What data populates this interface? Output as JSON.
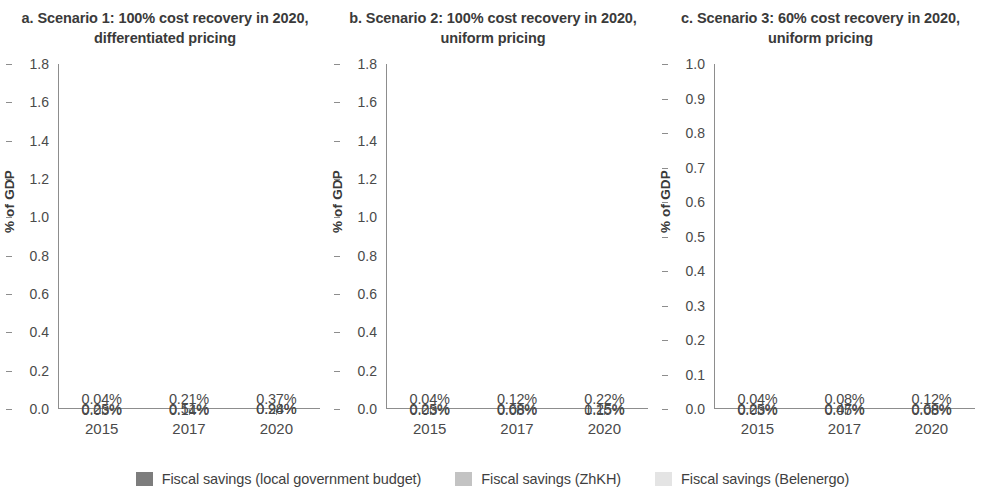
{
  "figure": {
    "ylabel": "% of GDP",
    "legend": {
      "position": "bottom",
      "items": [
        {
          "label": "Fiscal savings (local government budget)",
          "color": "#7d7d7d"
        },
        {
          "label": "Fiscal savings (ZhKH)",
          "color": "#c3c3c3"
        },
        {
          "label": "Fiscal savings (Belenergo)",
          "color": "#e4e4e4"
        }
      ]
    }
  },
  "chart_data": [
    {
      "type": "bar",
      "title": "a. Scenario 1: 100% cost recovery in 2020, differentiated pricing",
      "xlabel": "",
      "ylabel": "% of GDP",
      "ylim": [
        0.0,
        1.8
      ],
      "ytick_step": 0.2,
      "yticks": [
        "1.8",
        "1.6",
        "1.4",
        "1.2",
        "1.0",
        "0.8",
        "0.6",
        "0.4",
        "0.2",
        "0.0"
      ],
      "grid": false,
      "stacked": true,
      "categories": [
        "2015",
        "2017",
        "2020"
      ],
      "series": [
        {
          "name": "Fiscal savings (Belenergo)",
          "color": "#e4e4e4",
          "values": [
            0.25,
            0.51,
            0.98
          ],
          "labels": [
            "0.25%",
            "0.51%",
            "0.98%"
          ]
        },
        {
          "name": "Fiscal savings (ZhKH)",
          "color": "#c3c3c3",
          "values": [
            0.03,
            0.14,
            0.24
          ],
          "labels": [
            "0.03%",
            "0.14%",
            "0.24%"
          ]
        },
        {
          "name": "Fiscal savings (local government budget)",
          "color": "#7d7d7d",
          "values": [
            0.04,
            0.21,
            0.37
          ],
          "labels": [
            "0.04%",
            "0.21%",
            "0.37%"
          ]
        }
      ],
      "totals": [
        0.32,
        0.86,
        1.59
      ]
    },
    {
      "type": "bar",
      "title": "b. Scenario 2: 100% cost recovery in 2020, uniform pricing",
      "xlabel": "",
      "ylabel": "% of GDP",
      "ylim": [
        0.0,
        1.8
      ],
      "ytick_step": 0.2,
      "yticks": [
        "1.8",
        "1.6",
        "1.4",
        "1.2",
        "1.0",
        "0.8",
        "0.6",
        "0.4",
        "0.2",
        "0.0"
      ],
      "grid": false,
      "stacked": true,
      "categories": [
        "2015",
        "2017",
        "2020"
      ],
      "series": [
        {
          "name": "Fiscal savings (Belenergo)",
          "color": "#e4e4e4",
          "values": [
            0.25,
            0.68,
            1.25
          ],
          "labels": [
            "0.25%",
            "0.68%",
            "1.25%"
          ]
        },
        {
          "name": "Fiscal savings (ZhKH)",
          "color": "#c3c3c3",
          "values": [
            0.03,
            0.08,
            0.15
          ],
          "labels": [
            "0.03%",
            "0.08%",
            "0.15%"
          ]
        },
        {
          "name": "Fiscal savings (local government budget)",
          "color": "#7d7d7d",
          "values": [
            0.04,
            0.12,
            0.22
          ],
          "labels": [
            "0.04%",
            "0.12%",
            "0.22%"
          ]
        }
      ],
      "totals": [
        0.32,
        0.88,
        1.62
      ]
    },
    {
      "type": "bar",
      "title": "c. Scenario 3: 60% cost recovery in 2020, uniform pricing",
      "xlabel": "",
      "ylabel": "% of GDP",
      "ylim": [
        0.0,
        1.0
      ],
      "ytick_step": 0.1,
      "yticks": [
        "1.0",
        "0.9",
        "0.8",
        "0.7",
        "0.6",
        "0.5",
        "0.4",
        "0.3",
        "0.2",
        "0.1",
        "0.0"
      ],
      "grid": false,
      "stacked": true,
      "categories": [
        "2015",
        "2017",
        "2020"
      ],
      "series": [
        {
          "name": "Fiscal savings (Belenergo)",
          "color": "#e4e4e4",
          "values": [
            0.25,
            0.47,
            0.68
          ],
          "labels": [
            "0.25%",
            "0.47%",
            "0.68%"
          ]
        },
        {
          "name": "Fiscal savings (ZhKH)",
          "color": "#c3c3c3",
          "values": [
            0.03,
            0.05,
            0.08
          ],
          "labels": [
            "0.03%",
            "0.05%",
            "0.08%"
          ]
        },
        {
          "name": "Fiscal savings (local government budget)",
          "color": "#7d7d7d",
          "values": [
            0.04,
            0.08,
            0.12
          ],
          "labels": [
            "0.04%",
            "0.08%",
            "0.12%"
          ]
        }
      ],
      "totals": [
        0.32,
        0.6,
        0.88
      ]
    }
  ]
}
